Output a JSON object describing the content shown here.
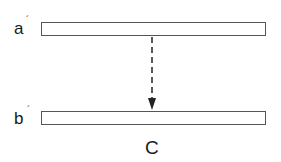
{
  "diagram": {
    "panel_label": "C",
    "bars": [
      {
        "label": "a",
        "prime": "´"
      },
      {
        "label": "b",
        "prime": "´"
      }
    ],
    "arrow": {
      "style": "dashed",
      "direction": "down",
      "from": "a",
      "to": "b"
    },
    "colors": {
      "stroke": "#555555",
      "text": "#1a1a1a",
      "background": "#ffffff"
    }
  }
}
